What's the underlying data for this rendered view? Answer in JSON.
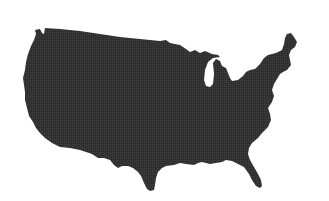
{
  "map": {
    "subject": "Contiguous United States silhouette",
    "fill_color": "#333333",
    "background_color": "#ffffff",
    "style": "solid dark silhouette with halftone texture, no labels"
  }
}
